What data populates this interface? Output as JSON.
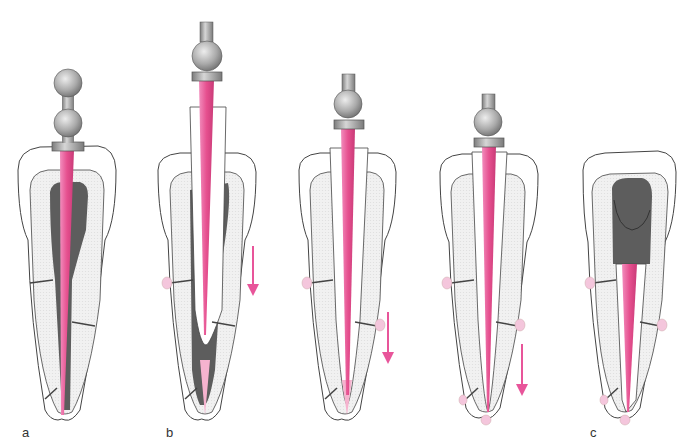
{
  "diagram": {
    "type": "endodontic instrumentation sequence",
    "colors": {
      "instrument": "#e8559a",
      "instrument_light": "#f6b3cf",
      "pulp": "#5d5d5d",
      "dentin": "#eeeeee",
      "outline": "#444444",
      "handle": "#a8a8a8",
      "arrow": "#e8559a",
      "lateral_canal_bulge": "#f4c6dc"
    },
    "panels": [
      {
        "id": "a",
        "label": "a",
        "cx": 68,
        "handle": "double-ball",
        "arrow": false
      },
      {
        "id": "b1",
        "label": "b",
        "cx": 206,
        "handle": "single-ball",
        "arrow": true
      },
      {
        "id": "b2",
        "label": "",
        "cx": 347,
        "handle": "single-ball",
        "arrow": true
      },
      {
        "id": "b3",
        "label": "",
        "cx": 488,
        "handle": "single-ball",
        "arrow": true
      },
      {
        "id": "c",
        "label": "c",
        "cx": 626,
        "handle": "none",
        "arrow": false
      }
    ]
  }
}
